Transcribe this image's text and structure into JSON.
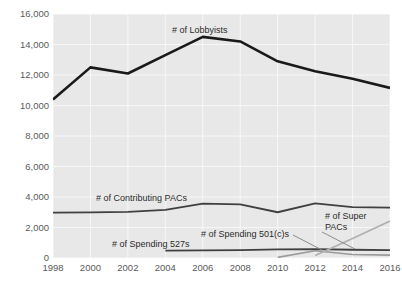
{
  "chart_data": {
    "type": "line",
    "title": "",
    "subtitle": "",
    "xlabel": "",
    "ylabel": "",
    "x": [
      1998,
      2000,
      2002,
      2004,
      2006,
      2008,
      2010,
      2012,
      2014,
      2016
    ],
    "xlim": [
      1998,
      2016
    ],
    "ylim": [
      0,
      16000
    ],
    "ytick_labels": [
      "0",
      "2,000",
      "4,000",
      "6,000",
      "8,000",
      "10,000",
      "12,000",
      "14,000",
      "16,000"
    ],
    "ytick_values": [
      0,
      2000,
      4000,
      6000,
      8000,
      10000,
      12000,
      14000,
      16000
    ],
    "xtick_labels": [
      "1998",
      "2000",
      "2002",
      "2004",
      "2006",
      "2008",
      "2010",
      "2012",
      "2014",
      "2016"
    ],
    "grid": true,
    "grid_color": "#f7f7f7",
    "plot_background": "#e8e8e8",
    "legend_position": "inline-annotations",
    "series": [
      {
        "name": "# of Lobbyists",
        "color": "#1a1a1a",
        "width": 2.6,
        "x": [
          1998,
          2000,
          2002,
          2004,
          2006,
          2008,
          2010,
          2012,
          2014,
          2016
        ],
        "values": [
          10400,
          12500,
          12100,
          13300,
          14500,
          14200,
          12900,
          12250,
          11750,
          11150
        ]
      },
      {
        "name": "# of Contributing PACs",
        "color": "#404040",
        "width": 1.8,
        "x": [
          1998,
          2000,
          2002,
          2004,
          2006,
          2008,
          2010,
          2012,
          2014,
          2016
        ],
        "values": [
          2970,
          2990,
          3030,
          3150,
          3560,
          3520,
          3000,
          3580,
          3330,
          3300
        ]
      },
      {
        "name": "# of Spending 527s",
        "color": "#404040",
        "width": 1.8,
        "x": [
          2004,
          2006,
          2008,
          2010,
          2012,
          2014,
          2016
        ],
        "values": [
          480,
          500,
          520,
          560,
          580,
          540,
          520
        ]
      },
      {
        "name": "# of Spending 501(c)s",
        "color": "#9a9a9a",
        "width": 1.6,
        "x": [
          2010,
          2012,
          2014,
          2016
        ],
        "values": [
          40,
          480,
          230,
          190
        ]
      },
      {
        "name": "# of Super PACs",
        "color": "#b0b0b0",
        "width": 1.6,
        "x": [
          2012,
          2014,
          2016
        ],
        "values": [
          170,
          1280,
          2420
        ]
      }
    ],
    "annotations": [
      {
        "text": "# of Lobbyists",
        "x_px": 172,
        "y_px": 25
      },
      {
        "text": "# of Contributing PACs",
        "x_px": 96,
        "y_px": 193
      },
      {
        "text": "# of Spending 527s",
        "x_px": 112,
        "y_px": 239
      },
      {
        "text": "# of Spending 501(c)s",
        "x_px": 201,
        "y_px": 229
      },
      {
        "text": "# of Super PACs",
        "x_px": 325,
        "y_px": 211
      }
    ],
    "leader_lines": [
      {
        "from_x_px": 293,
        "from_y_px": 235,
        "to_x_px": 322,
        "to_y_px": 250
      },
      {
        "from_x_px": 322,
        "from_y_px": 232,
        "to_x_px": 355,
        "to_y_px": 249
      }
    ]
  }
}
